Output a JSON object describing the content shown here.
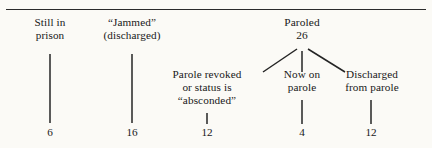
{
  "figure": {
    "type": "tree-diagram",
    "background_color": "#fbfaf6",
    "ink_color": "#181818",
    "top_rule": true
  },
  "nodes": {
    "still_in_prison": {
      "line1": "Still in",
      "line2": "prison",
      "count": "6"
    },
    "jammed": {
      "line1": "“Jammed”",
      "line2": "(discharged)",
      "count": "16"
    },
    "paroled": {
      "line1": "Paroled",
      "count": "26"
    },
    "parole_revoked": {
      "line1": "Parole revoked",
      "line2": "or status is",
      "line3": "“absconded”",
      "count": "12"
    },
    "now_on_parole": {
      "line1": "Now on",
      "line2": "parole",
      "count": "4"
    },
    "discharged_from_parole": {
      "line1": "Discharged",
      "line2": "from parole",
      "count": "12"
    }
  }
}
